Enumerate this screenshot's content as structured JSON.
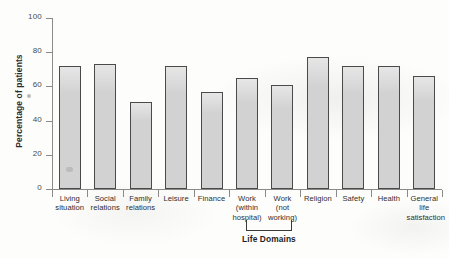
{
  "chart_data": {
    "type": "bar",
    "title": "",
    "xlabel": "Life Domains",
    "ylabel": "Percentage of patients",
    "ylim": [
      0,
      100
    ],
    "yticks": [
      0,
      20,
      40,
      60,
      80,
      100
    ],
    "grid": false,
    "legend": null,
    "categories": [
      "Living situation",
      "Social relations",
      "Family relations",
      "Leisure",
      "Finance",
      "Work (within hospital)",
      "Work (not working)",
      "Religion",
      "Safety",
      "Health",
      "General life satisfaction"
    ],
    "category_lines": [
      [
        "Living",
        "situation"
      ],
      [
        "Social",
        "relations"
      ],
      [
        "Family",
        "relations"
      ],
      [
        "Leisure"
      ],
      [
        "Finance"
      ],
      [
        "Work",
        "(within",
        "hospital)"
      ],
      [
        "Work",
        "(not",
        "working)"
      ],
      [
        "Religion"
      ],
      [
        "Safety"
      ],
      [
        "Health"
      ],
      [
        "General",
        "life",
        "satisfaction"
      ]
    ],
    "values": [
      72,
      73,
      51,
      72,
      57,
      65,
      61,
      77,
      72,
      72,
      66
    ],
    "bar_fill_color": "#d2d2d2",
    "bar_border_color": "#4a4a4a",
    "axis_color": "#8a8a8a",
    "bracket_spans": [
      "Work (within hospital)",
      "Work (not working)"
    ]
  }
}
